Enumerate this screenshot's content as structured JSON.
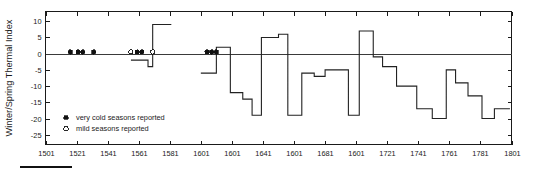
{
  "chart": {
    "ylabel": "Winter/Spring Thermal Index",
    "xlabel": "",
    "title": ""
  },
  "legend": {
    "items": [
      {
        "marker": "filled-circle",
        "label": "very cold seasons reported"
      },
      {
        "marker": "open-circle",
        "label": "mild seasons reported"
      }
    ]
  },
  "axes": {
    "y_ticks": [
      "10",
      "5",
      "0",
      "-5",
      "-10",
      "-15",
      "-20",
      "-25"
    ],
    "x_ticks": [
      "1501",
      "1521",
      "1541",
      "1561",
      "1581",
      "1601",
      "1601",
      "1641",
      "1601",
      "1681",
      "1601",
      "1721",
      "1741",
      "1761",
      "1781",
      "1801"
    ]
  },
  "chart_data": {
    "type": "line",
    "title": "",
    "xlabel": "",
    "ylabel": "Winter/Spring Thermal Index",
    "xlim": [
      1501,
      1801
    ],
    "ylim": [
      -28,
      13
    ],
    "grid": false,
    "legend_position": "lower-left",
    "y_ticks": [
      10,
      5,
      0,
      -5,
      -10,
      -15,
      -20,
      -25
    ],
    "x_ticks": [
      1501,
      1521,
      1541,
      1561,
      1581,
      1601,
      1621,
      1641,
      1661,
      1681,
      1701,
      1721,
      1741,
      1761,
      1781,
      1801
    ],
    "x_tick_labels": [
      "1501",
      "1521",
      "1541",
      "1561",
      "1581",
      "1601",
      "1601",
      "1641",
      "1601",
      "1681",
      "1601",
      "1721",
      "1741",
      "1761",
      "1781",
      "1801"
    ],
    "series": [
      {
        "name": "Winter/Spring Thermal Index",
        "style": "step",
        "segments": [
          {
            "x0": 1556,
            "x1": 1567,
            "y": -2
          },
          {
            "x0": 1567,
            "x1": 1570,
            "y": -4
          },
          {
            "x0": 1570,
            "x1": 1582,
            "y": 9
          },
          {
            "x0": 1601,
            "x1": 1611,
            "y": -6
          },
          {
            "x0": 1611,
            "x1": 1620,
            "y": 2
          },
          {
            "x0": 1620,
            "x1": 1628,
            "y": -12
          },
          {
            "x0": 1628,
            "x1": 1634,
            "y": -14
          },
          {
            "x0": 1634,
            "x1": 1640,
            "y": -19
          },
          {
            "x0": 1640,
            "x1": 1651,
            "y": 5
          },
          {
            "x0": 1651,
            "x1": 1657,
            "y": 6
          },
          {
            "x0": 1657,
            "x1": 1666,
            "y": -19
          },
          {
            "x0": 1666,
            "x1": 1674,
            "y": -6
          },
          {
            "x0": 1674,
            "x1": 1681,
            "y": -7
          },
          {
            "x0": 1681,
            "x1": 1696,
            "y": -5
          },
          {
            "x0": 1696,
            "x1": 1703,
            "y": -19
          },
          {
            "x0": 1703,
            "x1": 1712,
            "y": 7
          },
          {
            "x0": 1712,
            "x1": 1718,
            "y": -1
          },
          {
            "x0": 1718,
            "x1": 1727,
            "y": -4
          },
          {
            "x0": 1727,
            "x1": 1740,
            "y": -10
          },
          {
            "x0": 1740,
            "x1": 1750,
            "y": -17
          },
          {
            "x0": 1750,
            "x1": 1759,
            "y": -20
          },
          {
            "x0": 1759,
            "x1": 1765,
            "y": -5
          },
          {
            "x0": 1765,
            "x1": 1773,
            "y": -9
          },
          {
            "x0": 1773,
            "x1": 1782,
            "y": -13
          },
          {
            "x0": 1782,
            "x1": 1790,
            "y": -20
          },
          {
            "x0": 1790,
            "x1": 1800,
            "y": -17
          }
        ]
      }
    ],
    "markers": {
      "very_cold_seasons_reported": [
        1517,
        1522,
        1525,
        1532,
        1560,
        1563,
        1605,
        1608,
        1611
      ],
      "mild_seasons_reported": [
        1556,
        1570
      ]
    },
    "reference_lines": [
      {
        "axis": "y",
        "value": 0
      }
    ]
  }
}
